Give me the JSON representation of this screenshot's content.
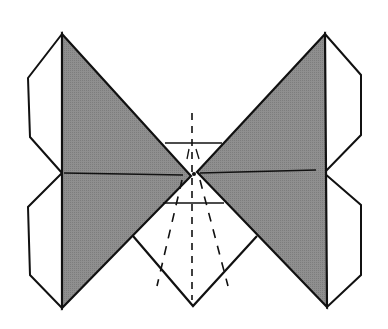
{
  "diagram": {
    "type": "origami-folding-step",
    "colors": {
      "background": "#ffffff",
      "line": "#111111",
      "shade": "#8a8a8a"
    },
    "elements": {
      "left_wing": {
        "label": "left shaded wing",
        "points": "62,34 191,176 62,308"
      },
      "right_wing": {
        "label": "right shaded wing",
        "points": "325,34 197,172 327,307"
      },
      "left_upper_flap": {
        "points": "62,34 28,78 30,137 62,173"
      },
      "left_lower_flap": {
        "points": "62,173 28,207 30,275 62,308"
      },
      "right_upper_flap": {
        "points": "325,34 361,75 361,135 324,173"
      },
      "right_lower_flap": {
        "points": "324,173 361,205 361,275 327,307"
      },
      "lower_diamond": {
        "points": "133,236 193,306 257,236"
      }
    }
  }
}
